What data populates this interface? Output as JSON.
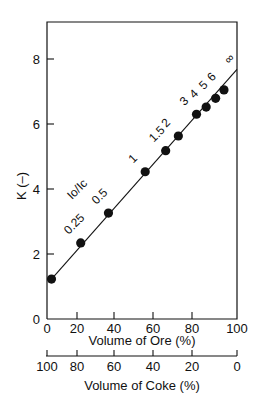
{
  "chart_data": {
    "type": "scatter",
    "title": "",
    "xlabel": "Volume of Ore (%)",
    "xlabel_secondary": "Volume of Coke (%)",
    "ylabel": "K (–)",
    "xlim": [
      0,
      100
    ],
    "ylim": [
      0,
      9
    ],
    "x_ticks": [
      "0",
      "20",
      "40",
      "60",
      "80",
      "100"
    ],
    "x_secondary_ticks": [
      "100",
      "80",
      "60",
      "40",
      "20",
      "0"
    ],
    "y_ticks": [
      "0",
      "2",
      "4",
      "6",
      "8"
    ],
    "grid": false,
    "legend": null,
    "annotation_header": "Io/Ic",
    "series": [
      {
        "name": "K vs ore volume",
        "points": [
          {
            "x": 3,
            "y": 1.23,
            "label": ""
          },
          {
            "x": 22,
            "y": 2.34,
            "label": "0.25"
          },
          {
            "x": 37,
            "y": 3.26,
            "label": "0.5"
          },
          {
            "x": 56,
            "y": 4.53,
            "label": "1"
          },
          {
            "x": 66.5,
            "y": 5.18,
            "label": "1.5"
          },
          {
            "x": 73,
            "y": 5.63,
            "label": "2"
          },
          {
            "x": 82,
            "y": 6.3,
            "label": "3"
          },
          {
            "x": 86.3,
            "y": 6.52,
            "label": "4"
          },
          {
            "x": 90.5,
            "y": 6.79,
            "label": "5"
          },
          {
            "x": 94.2,
            "y": 7.05,
            "label": "6"
          }
        ],
        "fit_line": {
          "x_start": 3,
          "y_start": 1.23,
          "x_end": 100,
          "y_end": 7.68,
          "end_label": "∞"
        }
      }
    ]
  }
}
